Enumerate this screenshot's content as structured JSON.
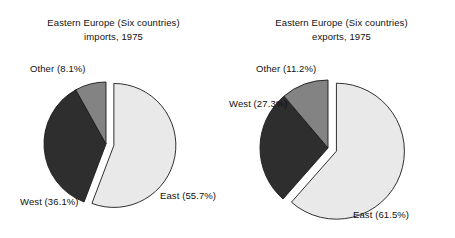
{
  "chart_data": [
    {
      "type": "pie",
      "id": "imports",
      "title": "Eastern Europe (Six countries) imports, 1975",
      "title_line1": "Eastern Europe (Six countries)",
      "title_line2": "imports, 1975",
      "categories": [
        "East",
        "West",
        "Other"
      ],
      "values": [
        55.7,
        36.1,
        8.1
      ],
      "unit": "%",
      "labels": [
        "East (55.7%)",
        "West (36.1%)",
        "Other (8.1%)"
      ],
      "slice_colors": [
        "#e9e9e9",
        "#2e2e2e",
        "#838383"
      ],
      "exploded": [
        "East"
      ],
      "start_angle_deg": 0,
      "direction": "clockwise",
      "legend": "none",
      "grid": false
    },
    {
      "type": "pie",
      "id": "exports",
      "title": "Eastern Europe (Six countries) exports, 1975",
      "title_line1": "Eastern Europe (Six countries)",
      "title_line2": "exports, 1975",
      "categories": [
        "East",
        "West",
        "Other"
      ],
      "values": [
        61.5,
        27.3,
        11.2
      ],
      "unit": "%",
      "labels": [
        "East (61.5%)",
        "West (27.3%)",
        "Other (11.2%)"
      ],
      "slice_colors": [
        "#e9e9e9",
        "#2e2e2e",
        "#838383"
      ],
      "exploded": [
        "East"
      ],
      "start_angle_deg": 0,
      "direction": "clockwise",
      "legend": "none",
      "grid": false
    }
  ],
  "figure": {
    "background": "#ffffff",
    "outline_color": "#1a1a1a"
  }
}
